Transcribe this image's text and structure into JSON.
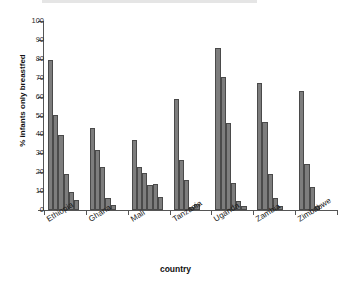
{
  "chart_data": {
    "type": "bar",
    "title": "",
    "subtitle": "",
    "xlabel": "country",
    "ylabel": "% infants only breastfed",
    "ylim": [
      0,
      100
    ],
    "ytick_values": [
      0,
      10,
      20,
      30,
      40,
      50,
      60,
      70,
      80,
      90,
      100
    ],
    "ytick_labels": [
      "0",
      "10",
      "20",
      "30",
      "40",
      "50",
      "60",
      "70",
      "80",
      "90",
      "100"
    ],
    "grid": false,
    "legend": false,
    "legend_position": "none",
    "bar_color": "#7d7d7d",
    "bar_edge_color": "#4a4a4a",
    "axis_color": "#555555",
    "categories": [
      "Ethiopia",
      "Ghana",
      "Mali",
      "Tanzania",
      "Uganda",
      "Zambia",
      "Zimbabwe"
    ],
    "series": [
      {
        "name": "bar 1",
        "values": [
          79.5,
          43.5,
          37.0,
          58.5,
          85.5,
          67.0,
          63.0
        ]
      },
      {
        "name": "bar 2",
        "values": [
          50.5,
          31.5,
          22.5,
          26.5,
          70.5,
          46.5,
          24.5
        ]
      },
      {
        "name": "bar 3",
        "values": [
          39.5,
          22.5,
          19.5,
          16.0,
          46.0,
          19.0,
          12.0
        ]
      },
      {
        "name": "bar 4",
        "values": [
          19.0,
          6.5,
          13.0,
          1.5,
          14.5,
          6.5,
          2.0
        ]
      },
      {
        "name": "bar 5",
        "values": [
          9.5,
          2.5,
          14.0,
          3.0,
          5.0,
          2.0,
          0.0
        ]
      },
      {
        "name": "bar 6",
        "values": [
          5.5,
          0.0,
          7.0,
          0.0,
          2.0,
          0.0,
          0.0
        ]
      }
    ],
    "annotations": []
  },
  "axes": {
    "y_title": "% infants only breastfed",
    "x_title": "country"
  }
}
